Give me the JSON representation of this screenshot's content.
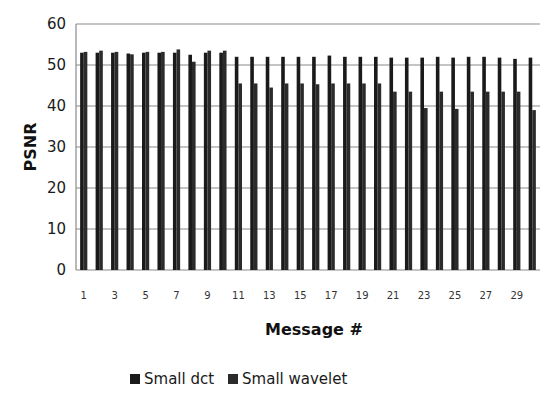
{
  "chart_data": {
    "type": "bar",
    "title": "",
    "xlabel": "Message #",
    "ylabel": "PSNR",
    "ylim": [
      0,
      60
    ],
    "yticks": [
      0,
      10,
      20,
      30,
      40,
      50,
      60
    ],
    "grid": true,
    "legend_position": "bottom",
    "categories": [
      1,
      2,
      3,
      4,
      5,
      6,
      7,
      8,
      9,
      10,
      11,
      12,
      13,
      14,
      15,
      16,
      17,
      18,
      19,
      20,
      21,
      22,
      23,
      24,
      25,
      26,
      27,
      28,
      29,
      30
    ],
    "xtick_labels": [
      "1",
      "3",
      "5",
      "7",
      "9",
      "11",
      "13",
      "15",
      "17",
      "19",
      "21",
      "23",
      "25",
      "27",
      "29"
    ],
    "series": [
      {
        "name": "Small dct",
        "color": "#1a1a1a",
        "values": [
          53.0,
          53.0,
          53.0,
          52.8,
          53.0,
          53.0,
          53.0,
          52.5,
          53.0,
          53.0,
          52.0,
          52.0,
          52.0,
          52.0,
          52.0,
          52.0,
          52.3,
          52.0,
          52.0,
          52.0,
          51.8,
          51.8,
          51.8,
          52.0,
          51.8,
          52.0,
          52.0,
          51.8,
          51.5,
          51.8
        ]
      },
      {
        "name": "Small wavelet",
        "color": "#2b2b2b",
        "values": [
          53.2,
          53.5,
          53.2,
          52.6,
          53.2,
          53.2,
          53.8,
          50.8,
          53.5,
          53.5,
          45.5,
          45.5,
          44.5,
          45.5,
          45.5,
          45.3,
          45.5,
          45.5,
          45.5,
          45.5,
          43.5,
          43.5,
          39.5,
          43.5,
          39.3,
          43.5,
          43.5,
          43.5,
          43.5,
          39.0
        ]
      }
    ]
  },
  "axis": {
    "xlabel": "Message #",
    "ylabel": "PSNR"
  },
  "legend": {
    "items": [
      {
        "label": "Small dct",
        "color": "#1a1a1a"
      },
      {
        "label": "Small wavelet",
        "color": "#2b2b2b"
      }
    ]
  }
}
